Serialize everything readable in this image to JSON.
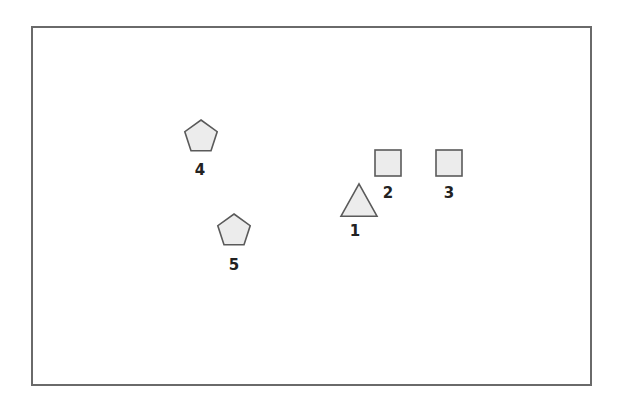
{
  "diagram": {
    "colors": {
      "stroke": "#5a5a5a",
      "fill": "#ececec",
      "frame": "#6a6a6a",
      "label": "#222222"
    },
    "nodes": [
      {
        "id": "1",
        "label": "1",
        "shape": "triangle",
        "cx": 359,
        "cy": 200,
        "size": 36,
        "label_x": 355,
        "label_y": 231
      },
      {
        "id": "2",
        "label": "2",
        "shape": "square",
        "cx": 388,
        "cy": 163,
        "size": 26,
        "label_x": 388,
        "label_y": 193
      },
      {
        "id": "3",
        "label": "3",
        "shape": "square",
        "cx": 449,
        "cy": 163,
        "size": 26,
        "label_x": 449,
        "label_y": 193
      },
      {
        "id": "4",
        "label": "4",
        "shape": "pentagon",
        "cx": 201,
        "cy": 137,
        "size": 34,
        "label_x": 200,
        "label_y": 170
      },
      {
        "id": "5",
        "label": "5",
        "shape": "pentagon",
        "cx": 234,
        "cy": 231,
        "size": 34,
        "label_x": 234,
        "label_y": 265
      }
    ]
  }
}
